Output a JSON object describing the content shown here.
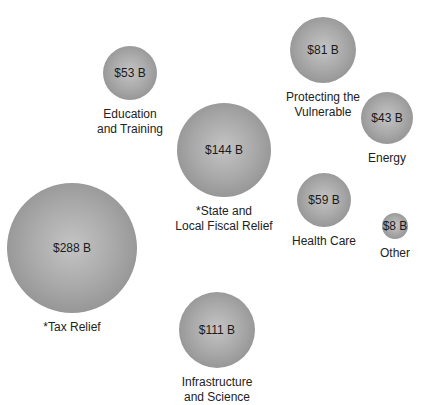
{
  "chart_data": {
    "type": "bubble",
    "title": "",
    "unit": "Billions of dollars",
    "items": [
      {
        "label": "Education\nand Training",
        "value": 53,
        "value_label": "$53 B",
        "cx": 130,
        "cy": 73,
        "r": 27,
        "ly": 105
      },
      {
        "label": "*State and\nLocal Fiscal Relief",
        "value": 144,
        "value_label": "$144 B",
        "cx": 224,
        "cy": 150,
        "r": 47,
        "ly": 200
      },
      {
        "label": "Protecting the\nVulnerable",
        "value": 81,
        "value_label": "$81 B",
        "cx": 323,
        "cy": 50,
        "r": 33,
        "ly": 87
      },
      {
        "label": "Energy",
        "value": 43,
        "value_label": "$43 B",
        "cx": 387,
        "cy": 118,
        "r": 26,
        "ly": 148
      },
      {
        "label": "Health Care",
        "value": 59,
        "value_label": "$59 B",
        "cx": 324,
        "cy": 200,
        "r": 27,
        "ly": 231
      },
      {
        "label": "Other",
        "value": 8,
        "value_label": "$8 B",
        "cx": 395,
        "cy": 226,
        "r": 13,
        "ly": 244
      },
      {
        "label": "*Tax Relief",
        "value": 288,
        "value_label": "$288 B",
        "cx": 72,
        "cy": 248,
        "r": 65,
        "ly": 297
      },
      {
        "label": "Infrastructure\nand Science",
        "value": 111,
        "value_label": "$111 B",
        "cx": 217,
        "cy": 330,
        "r": 38,
        "ly": 345
      }
    ]
  }
}
